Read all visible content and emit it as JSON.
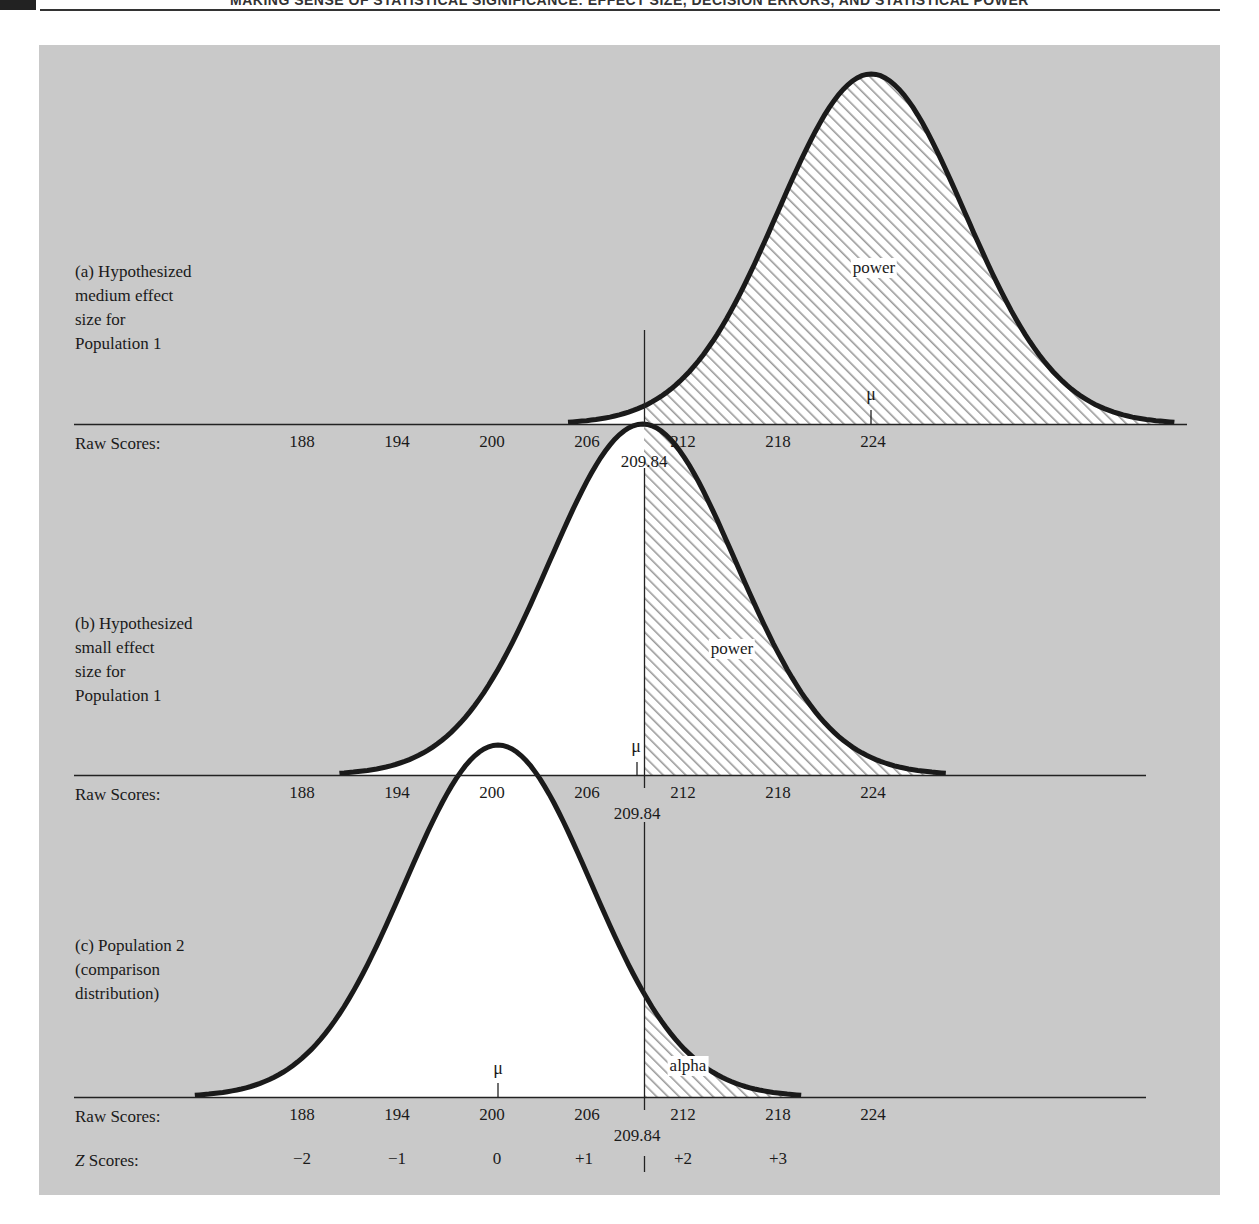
{
  "header": {
    "page_number": "",
    "running_title": "MAKING SENSE OF STATISTICAL SIGNIFICANCE: EFFECT SIZE, DECISION ERRORS, AND STATISTICAL POWER"
  },
  "colors": {
    "panel_background": "#c9c9c9",
    "curve": "#1a1a1a",
    "fill": "#ffffff",
    "hatch": "#9a9a9a"
  },
  "panels": [
    {
      "id": "a",
      "label_lines": [
        "(a) Hypothesized",
        "medium effect",
        "size for",
        "Population 1"
      ],
      "mean": 224,
      "mean_symbol": "μ",
      "area_label": "power",
      "axis_label": "Raw Scores:",
      "ticks": [
        "188",
        "194",
        "200",
        "206",
        "212",
        "218",
        "224"
      ],
      "cutoff": "209.84"
    },
    {
      "id": "b",
      "label_lines": [
        "(b) Hypothesized",
        "small effect",
        "size for",
        "Population 1"
      ],
      "mean": 209,
      "mean_symbol": "μ",
      "area_label": "power",
      "axis_label": "Raw Scores:",
      "ticks": [
        "188",
        "194",
        "200",
        "206",
        "212",
        "218",
        "224"
      ],
      "cutoff": "209.84"
    },
    {
      "id": "c",
      "label_lines": [
        "(c) Population 2",
        "(comparison",
        "distribution)"
      ],
      "mean": 200,
      "mean_symbol": "μ",
      "area_label": "alpha",
      "axis_label": "Raw Scores:",
      "ticks": [
        "188",
        "194",
        "200",
        "206",
        "212",
        "218",
        "224"
      ],
      "cutoff": "209.84",
      "z_axis_label": "Z Scores:",
      "z_ticks": [
        "−2",
        "−1",
        "0",
        "+1",
        "+2",
        "+3"
      ],
      "z_cutoff_marker": "|"
    }
  ],
  "chart_data": {
    "type": "area",
    "xlabel": "Raw Scores / Z Scores",
    "ylabel": "",
    "x_ticks_raw": [
      188,
      194,
      200,
      206,
      212,
      218,
      224
    ],
    "x_ticks_z": [
      "-2",
      "-1",
      "0",
      "+1",
      "+2",
      "+3"
    ],
    "cutoff_raw_score": 209.84,
    "sd": 6,
    "series": [
      {
        "name": "(a) Hypothesized medium effect size for Population 1",
        "mean": 224,
        "shaded_region": "x > 209.84",
        "shaded_label": "power"
      },
      {
        "name": "(b) Hypothesized small effect size for Population 1",
        "mean": 209,
        "shaded_region": "x > 209.84",
        "shaded_label": "power"
      },
      {
        "name": "(c) Population 2 (comparison distribution)",
        "mean": 200,
        "shaded_region": "x > 209.84",
        "shaded_label": "alpha"
      }
    ],
    "grid": false,
    "legend": "none"
  }
}
